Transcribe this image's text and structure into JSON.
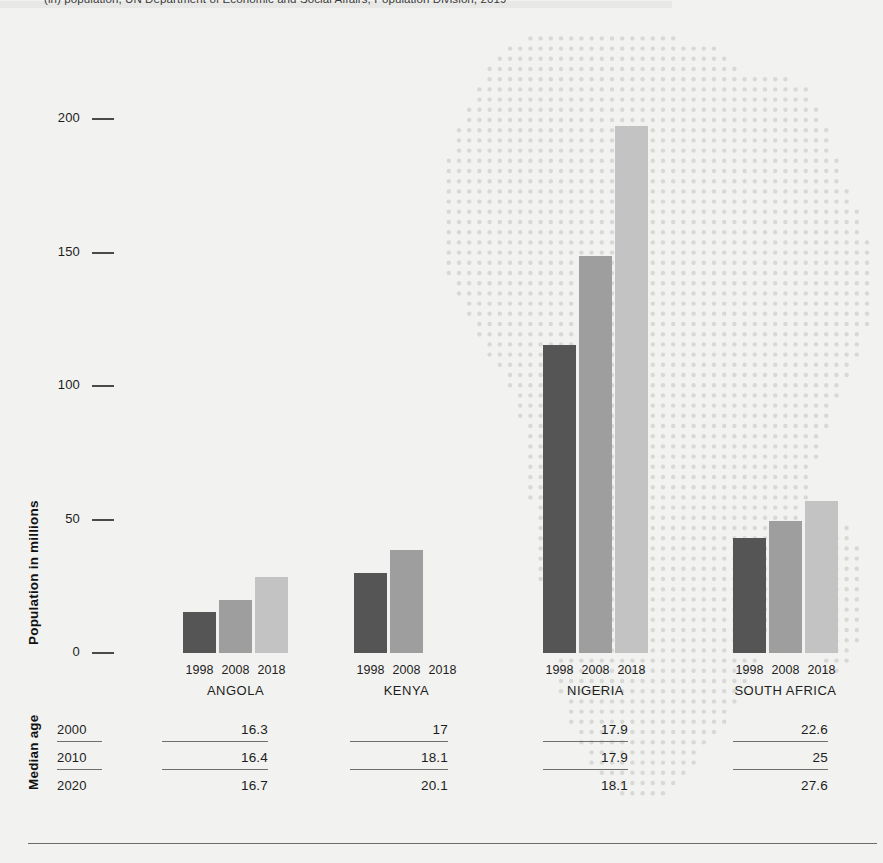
{
  "source_note": "(in) population, UN Department of Economic and Social Affairs, Population Division, 2019",
  "axis": {
    "y_title": "Population in millions",
    "y_ticks": [
      "200",
      "150",
      "100",
      "50",
      "0"
    ],
    "y_tick_values": [
      200,
      150,
      100,
      50,
      0
    ],
    "median_age_title": "Median age"
  },
  "legend_years": [
    "1998",
    "2008",
    "2018"
  ],
  "colors": {
    "bar_1998": "#555555",
    "bar_2008": "#9e9e9e",
    "bar_2018": "#c3c3c3",
    "background": "#f2f2f0",
    "map_dots": "#d8d8d6",
    "rule": "#6f6f6f",
    "text": "#1d1d1d"
  },
  "chart_data": {
    "type": "bar",
    "title": "",
    "xlabel": "",
    "ylabel": "Population in millions",
    "ylim": [
      0,
      200
    ],
    "categories": [
      "ANGOLA",
      "KENYA",
      "NIGERIA",
      "SOUTH AFRICA"
    ],
    "grid": false,
    "legend_position": "per-group x-axis labels",
    "series": [
      {
        "name": "1998",
        "values": [
          15.2,
          30.0,
          115.2,
          43.2
        ]
      },
      {
        "name": "2008",
        "values": [
          20.0,
          38.5,
          148.8,
          49.6
        ]
      },
      {
        "name": "2018",
        "values": [
          28.5,
          0.0,
          197.5,
          57.0
        ]
      }
    ]
  },
  "median_age": {
    "row_years": [
      "2000",
      "2010",
      "2020"
    ],
    "columns": [
      "ANGOLA",
      "KENYA",
      "NIGERIA",
      "SOUTH AFRICA"
    ],
    "rows": [
      {
        "year": "2000",
        "values": [
          "16.3",
          "17",
          "17.9",
          "22.6"
        ]
      },
      {
        "year": "2010",
        "values": [
          "16.4",
          "18.1",
          "17.9",
          "25"
        ]
      },
      {
        "year": "2020",
        "values": [
          "16.7",
          "20.1",
          "18.1",
          "27.6"
        ]
      }
    ]
  },
  "groups": [
    {
      "country": "ANGOLA",
      "bars": [
        {
          "year": "1998",
          "value": 15.2
        },
        {
          "year": "2008",
          "value": 20.0
        },
        {
          "year": "2018",
          "value": 28.5
        }
      ]
    },
    {
      "country": "KENYA",
      "bars": [
        {
          "year": "1998",
          "value": 30.0
        },
        {
          "year": "2008",
          "value": 38.5
        },
        {
          "year": "2018",
          "value": 0.0
        }
      ]
    },
    {
      "country": "NIGERIA",
      "bars": [
        {
          "year": "1998",
          "value": 115.2
        },
        {
          "year": "2008",
          "value": 148.8
        },
        {
          "year": "2018",
          "value": 197.5
        }
      ]
    },
    {
      "country": "SOUTH AFRICA",
      "bars": [
        {
          "year": "1998",
          "value": 43.2
        },
        {
          "year": "2008",
          "value": 49.6
        },
        {
          "year": "2018",
          "value": 57.0
        }
      ]
    }
  ]
}
